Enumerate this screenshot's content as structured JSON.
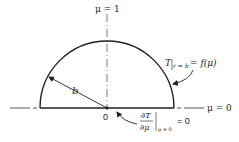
{
  "diagram": {
    "type": "hemisphere-boundary-conditions",
    "labels": {
      "top_axis": "μ = 1",
      "right_axis": "μ = 0",
      "origin": "0",
      "radius": "b",
      "surface_condition_main": "T",
      "surface_condition_sub": "r = b",
      "surface_condition_rhs": "= f(μ)",
      "base_condition_num": "∂T",
      "base_condition_den": "∂μ",
      "base_condition_sub": "μ = 0",
      "base_condition_rhs": "= 0"
    },
    "colors": {
      "stroke": "#222222",
      "background": "#ffffff"
    }
  }
}
